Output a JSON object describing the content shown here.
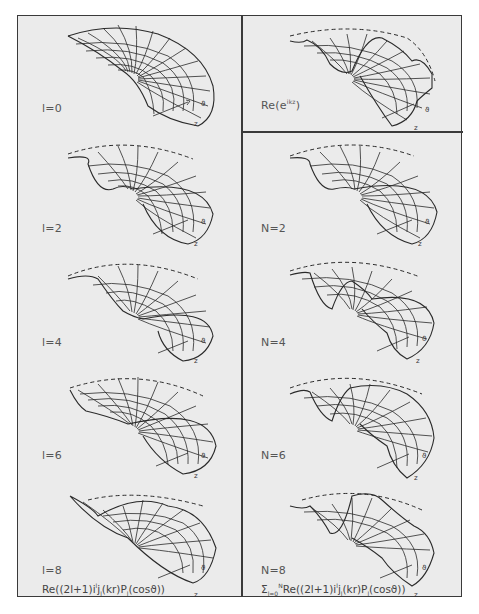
{
  "figure": {
    "left_column": {
      "panels": [
        {
          "label": "l=0"
        },
        {
          "label": "l=2"
        },
        {
          "label": "l=4"
        },
        {
          "label": "l=6"
        },
        {
          "label": "l=8"
        }
      ],
      "caption": {
        "prefix": "Re((2l+1)i",
        "sup1": "l",
        "mid1": "j",
        "sub1": "l",
        "mid2": "(kr)P",
        "sub2": "l",
        "suffix": "(cosϑ))"
      }
    },
    "right_column": {
      "top_panel": {
        "label_base": "Re(e",
        "label_sup": "ikz",
        "label_close": ")"
      },
      "panels": [
        {
          "label": "N=2"
        },
        {
          "label": "N=4"
        },
        {
          "label": "N=6"
        },
        {
          "label": "N=8"
        }
      ],
      "caption": {
        "sigma": "Σ",
        "sub": "l=0",
        "sup": "N",
        "prefix": "Re((2l+1)i",
        "sup1": "l",
        "mid1": "j",
        "sub1": "l",
        "mid2": "(kr)P",
        "sub2": "l",
        "suffix": "(cosϑ))"
      }
    },
    "axis_glyphs": {
      "z": "z",
      "theta": "ϑ",
      "r": "r"
    }
  }
}
